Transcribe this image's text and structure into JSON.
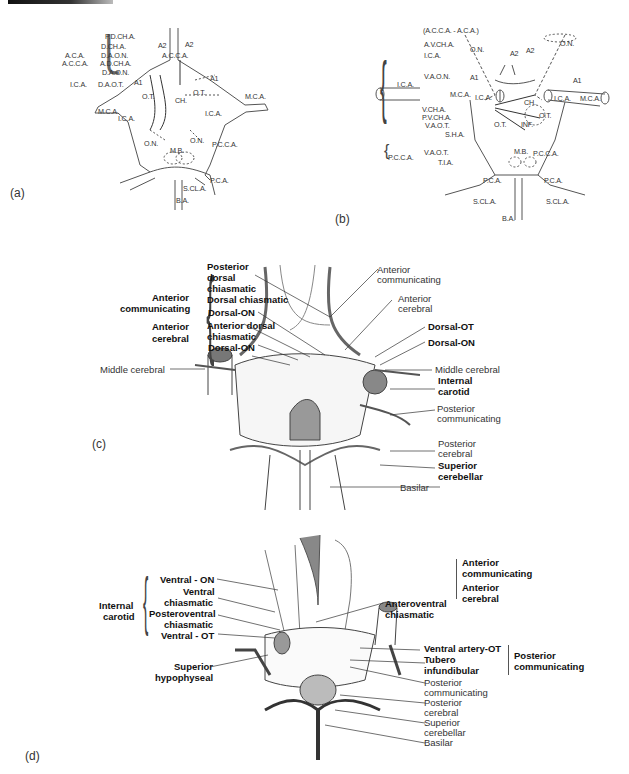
{
  "panels": {
    "a": {
      "label": "(a)",
      "left_group": {
        "outer": [
          "A.C.A.",
          "A.C.C.A."
        ],
        "ica": "I.C.A.",
        "items": [
          "P.D.CH.A.",
          "D.CH.A.",
          "D.A.O.N.",
          "A.D.CH.A.",
          "D.A.O.N.",
          "D.A.O.T."
        ]
      },
      "structure_labels": [
        "A2",
        "A2",
        "A.C.C.A.",
        "A1",
        "A1",
        "O.T.",
        "O.T.",
        "CH.",
        "M.C.A.",
        "M.C.A.",
        "I.C.A.",
        "I.C.A.",
        "O.N.",
        "O.N.",
        "M.B.",
        "P.C.C.A.",
        "P.C.A.",
        "S.CL.A.",
        "B.A."
      ]
    },
    "b": {
      "label": "(b)",
      "top_item": "(A.C.C.A. - A.C.A.)",
      "ica_group": {
        "label": "I.C.A.",
        "items": [
          "A.V.CH.A.",
          "I.C.A.",
          "V.A.O.N.",
          "V.CH.A.",
          "P.V.CH.A.",
          "V.A.O.T.",
          "S.H.A."
        ]
      },
      "pcca_group": {
        "label": "P.C.C.A.",
        "items": [
          "V.A.O.T.",
          "T.I.A."
        ]
      },
      "structure_labels": [
        "O.N.",
        "O.N.",
        "A2",
        "A2",
        "A1",
        "A1",
        "M.C.A.",
        "M.C.A.",
        "I.C.A.",
        "I.C.A.",
        "CH.",
        "O.T.",
        "O.T.",
        "INF.",
        "M.B.",
        "P.C.C.A.",
        "P.C.A.",
        "P.C.A.",
        "S.CL.A.",
        "S.CL.A.",
        "B.A."
      ]
    },
    "c": {
      "label": "(c)",
      "left_group": {
        "outer": [
          "Anterior",
          "communicating",
          "Anterior",
          "cerebral"
        ],
        "items": [
          "Posterior",
          "dorsal",
          "chiasmatic",
          "Dorsal chiasmatic",
          "Dorsal-ON",
          "Anterior dorsal",
          "chiasmatic",
          "Dorsal-ON"
        ]
      },
      "left_single": "Middle cerebral",
      "right_labels": [
        {
          "text": "Anterior",
          "bold": false
        },
        {
          "text": "communicating",
          "bold": false
        },
        {
          "text": "Anterior",
          "bold": false
        },
        {
          "text": "cerebral",
          "bold": false
        },
        {
          "text": "Dorsal-OT",
          "bold": true
        },
        {
          "text": "Dorsal-ON",
          "bold": true
        },
        {
          "text": "Middle cerebral",
          "bold": false
        },
        {
          "text": "Internal",
          "bold": true
        },
        {
          "text": "carotid",
          "bold": true
        },
        {
          "text": "Posterior",
          "bold": false
        },
        {
          "text": "communicating",
          "bold": false
        },
        {
          "text": "Posterior",
          "bold": false
        },
        {
          "text": "cerebral",
          "bold": false
        },
        {
          "text": "Superior",
          "bold": true
        },
        {
          "text": "cerebellar",
          "bold": true
        },
        {
          "text": "Basilar",
          "bold": false
        }
      ]
    },
    "d": {
      "label": "(d)",
      "left_group": {
        "outer": [
          "Internal",
          "carotid"
        ],
        "items": [
          "Ventral - ON",
          "Ventral",
          "chiasmatic",
          "Posteroventral",
          "chiasmatic",
          "Ventral - OT"
        ]
      },
      "left_single": [
        "Superior",
        "hypophyseal"
      ],
      "right_top": [
        "Anteroventral",
        "chiasmatic"
      ],
      "right_top_group": [
        "Anterior",
        "communicating",
        "Anterior",
        "cerebral"
      ],
      "right_mid": [
        "Ventral artery-OT",
        "Tubero",
        "infundibular"
      ],
      "right_mid_group": [
        "Posterior",
        "communicating"
      ],
      "right_plain": [
        "Posterior",
        "communicating",
        "Posterior",
        "cerebral",
        "Superior",
        "cerebellar",
        "Basilar"
      ]
    }
  }
}
